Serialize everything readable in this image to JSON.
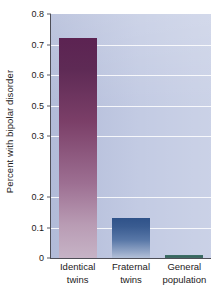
{
  "chart_data": {
    "type": "bar",
    "title": "",
    "xlabel": "",
    "ylabel": "Percent with bipolar disorder",
    "categories": [
      "Identical twins",
      "Fraternal twins",
      "General population"
    ],
    "category_lines": [
      [
        "Identical",
        "twins"
      ],
      [
        "Fraternal",
        "twins"
      ],
      [
        "General",
        "population"
      ]
    ],
    "values": [
      0.72,
      0.13,
      0.01
    ],
    "ylim": [
      0,
      0.8
    ],
    "grid": true,
    "legend": "none",
    "y_tick_labels": [
      "0.8",
      "0.7",
      "0.6",
      "0.5",
      "0.3",
      "0.2",
      "0.1",
      "0"
    ],
    "y_tick_positions": [
      0.8,
      0.7,
      0.6,
      0.5,
      0.4,
      0.2,
      0.1,
      0.0
    ],
    "bar_colors": [
      "#5c2352",
      "#2f5289",
      "#3f7169"
    ],
    "panel_color": "#bcc5e0",
    "gridline_color": "#ffffff",
    "axis_color": "#4e4e57"
  }
}
